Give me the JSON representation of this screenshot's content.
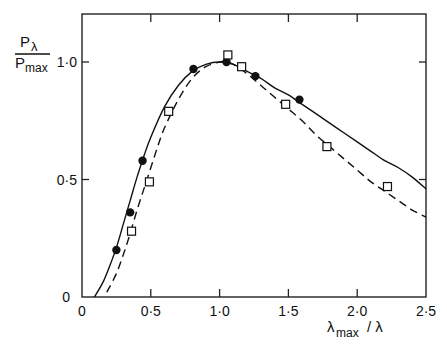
{
  "chart_data": {
    "type": "line",
    "title": "",
    "ylabel_numerator": "P",
    "ylabel_numerator_sub": "λ",
    "ylabel_denominator": "P",
    "ylabel_denominator_sub": "max",
    "xlabel_main": "λ",
    "xlabel_sub": "max",
    "xlabel_tail": "/ λ",
    "xlim": [
      0,
      2.5
    ],
    "ylim": [
      0,
      1.0
    ],
    "x_ticks": [
      0,
      0.5,
      1.0,
      1.5,
      2.0,
      2.5
    ],
    "x_tick_labels": [
      "0",
      "0·5",
      "1·0",
      "1·5",
      "2·0",
      "2·5"
    ],
    "y_ticks": [
      0,
      0.5,
      1.0
    ],
    "y_tick_labels": [
      "0",
      "0·5",
      "1·0"
    ],
    "grid": false,
    "legend": null,
    "series": [
      {
        "name": "solid curve",
        "style": "solid",
        "x": [
          0.09,
          0.15,
          0.2,
          0.25,
          0.3,
          0.35,
          0.4,
          0.45,
          0.5,
          0.6,
          0.7,
          0.8,
          0.9,
          1.0,
          1.1,
          1.2,
          1.3,
          1.4,
          1.5,
          1.6,
          1.7,
          1.8,
          1.9,
          2.0,
          2.1,
          2.2,
          2.3,
          2.4,
          2.5
        ],
        "y": [
          0.0,
          0.06,
          0.13,
          0.21,
          0.31,
          0.41,
          0.51,
          0.6,
          0.68,
          0.81,
          0.9,
          0.96,
          0.99,
          1.0,
          0.99,
          0.96,
          0.93,
          0.89,
          0.86,
          0.82,
          0.78,
          0.74,
          0.7,
          0.66,
          0.62,
          0.58,
          0.55,
          0.51,
          0.46
        ]
      },
      {
        "name": "dashed curve",
        "style": "dashed",
        "x": [
          0.18,
          0.25,
          0.3,
          0.35,
          0.4,
          0.45,
          0.5,
          0.55,
          0.6,
          0.7,
          0.8,
          0.9,
          1.0,
          1.05,
          1.1,
          1.2,
          1.3,
          1.4,
          1.5,
          1.6,
          1.7,
          1.8,
          1.9,
          2.0,
          2.1,
          2.2,
          2.3,
          2.4,
          2.5
        ],
        "y": [
          0.02,
          0.1,
          0.18,
          0.27,
          0.37,
          0.46,
          0.55,
          0.64,
          0.72,
          0.84,
          0.93,
          0.98,
          1.0,
          1.0,
          0.99,
          0.95,
          0.9,
          0.85,
          0.8,
          0.75,
          0.69,
          0.64,
          0.59,
          0.54,
          0.49,
          0.45,
          0.41,
          0.37,
          0.34
        ]
      },
      {
        "name": "filled circles",
        "style": "marker-circle",
        "x": [
          0.25,
          0.35,
          0.44,
          0.81,
          1.05,
          1.26,
          1.58
        ],
        "y": [
          0.2,
          0.36,
          0.58,
          0.97,
          1.0,
          0.94,
          0.84
        ]
      },
      {
        "name": "open squares",
        "style": "marker-square",
        "x": [
          0.36,
          0.49,
          0.63,
          1.06,
          1.16,
          1.48,
          1.78,
          2.22
        ],
        "y": [
          0.28,
          0.49,
          0.79,
          1.03,
          0.98,
          0.82,
          0.64,
          0.47
        ]
      }
    ]
  }
}
